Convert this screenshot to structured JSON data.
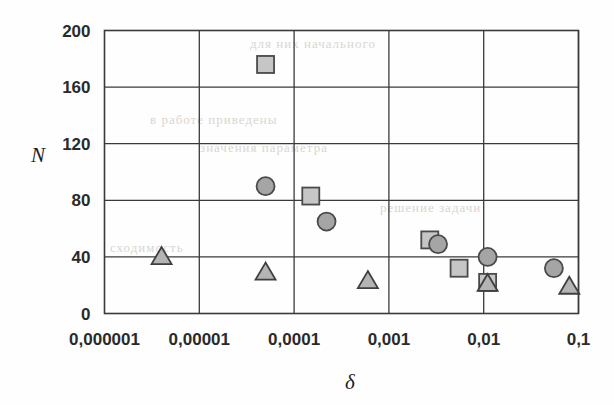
{
  "chart_data": {
    "type": "scatter",
    "title": "",
    "xlabel": "δ",
    "ylabel": "N",
    "xscale": "log",
    "yscale": "linear",
    "xlim": [
      1e-06,
      0.1
    ],
    "ylim": [
      0,
      200
    ],
    "grid": true,
    "legend": "none",
    "x_tick_labels": [
      "0,000001",
      "0,00001",
      "0,0001",
      "0,001",
      "0,01",
      "0,1"
    ],
    "x_tick_values": [
      1e-06,
      1e-05,
      0.0001,
      0.001,
      0.01,
      0.1
    ],
    "y_tick_labels": [
      "0",
      "40",
      "80",
      "120",
      "160",
      "200"
    ],
    "y_tick_values": [
      0,
      40,
      80,
      120,
      160,
      200
    ],
    "decimal_separator": ",",
    "series": [
      {
        "name": "squares",
        "marker": "square",
        "color": "#c6c6c6",
        "edge_color": "#4a4a4a",
        "points": [
          {
            "x": 5e-05,
            "y": 176
          },
          {
            "x": 0.00015,
            "y": 83
          },
          {
            "x": 0.0027,
            "y": 52
          },
          {
            "x": 0.0055,
            "y": 32
          },
          {
            "x": 0.011,
            "y": 22
          }
        ]
      },
      {
        "name": "circles",
        "marker": "circle",
        "color": "#a5a5a5",
        "edge_color": "#4a4a4a",
        "points": [
          {
            "x": 5e-05,
            "y": 90
          },
          {
            "x": 0.00022,
            "y": 65
          },
          {
            "x": 0.0033,
            "y": 49
          },
          {
            "x": 0.011,
            "y": 40
          },
          {
            "x": 0.055,
            "y": 32
          }
        ]
      },
      {
        "name": "triangles",
        "marker": "triangle",
        "color": "#b4b4b4",
        "edge_color": "#3f3f3f",
        "points": [
          {
            "x": 4e-06,
            "y": 40
          },
          {
            "x": 5e-05,
            "y": 29
          },
          {
            "x": 0.0006,
            "y": 23
          },
          {
            "x": 0.011,
            "y": 21
          },
          {
            "x": 0.08,
            "y": 19
          }
        ]
      }
    ]
  },
  "background_artifacts": {
    "note": "faint bleed-through text from reverse page of scan",
    "lines": [
      {
        "text": "для  них  начального",
        "x": 250,
        "y": 36
      },
      {
        "text": "в  работе  приведены",
        "x": 150,
        "y": 112
      },
      {
        "text": "значения  параметра",
        "x": 200,
        "y": 140
      },
      {
        "text": "решение  задачи",
        "x": 380,
        "y": 200
      },
      {
        "text": "сходимость",
        "x": 110,
        "y": 240
      }
    ]
  }
}
